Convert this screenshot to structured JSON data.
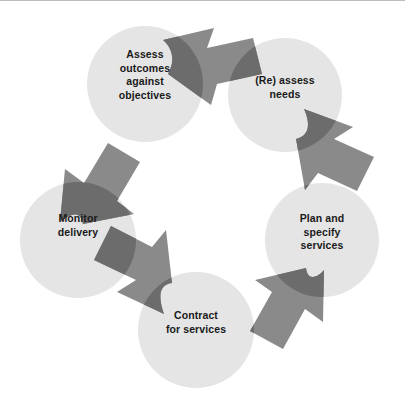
{
  "figure": {
    "type": "cycle-diagram",
    "direction": "clockwise",
    "width": 405,
    "height": 407,
    "background_color": "#ffffff",
    "rule_color": "#bdbdbd"
  },
  "style": {
    "circle_fill": "#e5e5e5",
    "arrow_fill": "#808080",
    "arrow_overlap_fill": "#6e6e6e",
    "label_color": "#1a1a1a"
  },
  "nodes": [
    {
      "id": "assess-outcomes",
      "label": "Assess\noutcomes\nagainst\nobjectives",
      "cx": 145,
      "cy": 84,
      "r": 58
    },
    {
      "id": "reassess-needs",
      "label": "(Re) assess\nneeds",
      "cx": 285,
      "cy": 95,
      "r": 57
    },
    {
      "id": "plan-specify",
      "label": "Plan and\nspecify\nservices",
      "cx": 322,
      "cy": 240,
      "r": 57
    },
    {
      "id": "contract",
      "label": "Contract\nfor services",
      "cx": 196,
      "cy": 330,
      "r": 58
    },
    {
      "id": "monitor-delivery",
      "label": "Monitor\ndelivery",
      "cx": 78,
      "cy": 240,
      "r": 58
    }
  ],
  "arrows": [
    {
      "id": "arrow-assess-to-reassess",
      "from": "assess-outcomes",
      "to": "reassess-needs",
      "direction": "right"
    },
    {
      "id": "arrow-reassess-to-plan",
      "from": "reassess-needs",
      "to": "plan-specify",
      "direction": "down-right"
    },
    {
      "id": "arrow-plan-to-contract",
      "from": "plan-specify",
      "to": "contract",
      "direction": "down-left"
    },
    {
      "id": "arrow-contract-to-monitor",
      "from": "contract",
      "to": "monitor-delivery",
      "direction": "up-left"
    },
    {
      "id": "arrow-monitor-to-assess",
      "from": "monitor-delivery",
      "to": "assess-outcomes",
      "direction": "up-right"
    }
  ]
}
